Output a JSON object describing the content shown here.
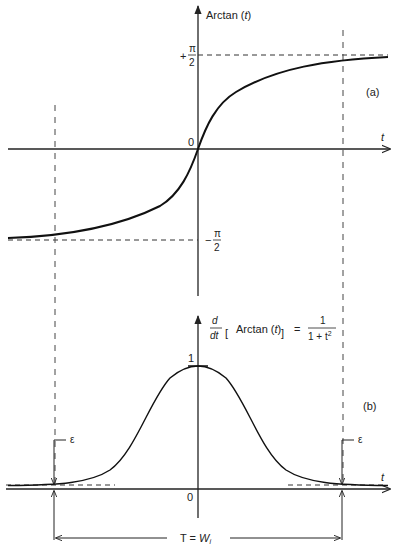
{
  "figure": {
    "panel_a": {
      "label": "(a)",
      "y_axis_label_prefix": "Arctan (",
      "y_axis_label_var": "t",
      "y_axis_label_suffix": ")",
      "x_axis_label": "t",
      "origin_label": "0",
      "upper_asymptote_sign": "+",
      "upper_asymptote_num": "π",
      "upper_asymptote_den": "2",
      "lower_asymptote_sign": "−",
      "lower_asymptote_num": "π",
      "lower_asymptote_den": "2",
      "curve": "Arctan(t)"
    },
    "panel_b": {
      "label": "(b)",
      "formula_d": "d",
      "formula_dt": "dt",
      "formula_inner": "Arctan (",
      "formula_var": "t",
      "formula_close": ")",
      "formula_equals": "=",
      "formula_num": "1",
      "formula_den": "1 + t",
      "formula_exp": "2",
      "peak_label": "1",
      "x_axis_label": "t",
      "origin_label": "0",
      "epsilon_left": "ε",
      "epsilon_right": "ε",
      "width_label_prefix": "T = ",
      "width_label_var": "W",
      "width_label_sub": "i",
      "curve": "1/(1+t^2)"
    }
  }
}
